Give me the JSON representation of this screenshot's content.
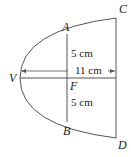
{
  "diagram": {
    "type": "parabolic-reflector-cross-section",
    "points": {
      "V": "V",
      "A": "A",
      "B": "B",
      "C": "C",
      "D": "D",
      "F": "F"
    },
    "measurements": {
      "upper": "5 cm",
      "lower": "5 cm",
      "depth": "11 cm"
    },
    "colors": {
      "stroke": "#555555",
      "text": "#222222",
      "background": "#ffffff"
    }
  }
}
